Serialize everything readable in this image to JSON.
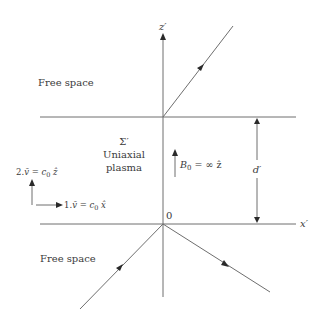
{
  "diagram": {
    "regions": {
      "top": "Free space",
      "middle_symbol": "Σ′",
      "middle_line1": "Uniaxial",
      "middle_line2": "plasma",
      "bottom": "Free space"
    },
    "axes": {
      "vertical_label": "z′",
      "horizontal_label": "x′",
      "origin_label": "0"
    },
    "field": {
      "label_prefix": "B",
      "label_sub": "0",
      "label_rest": " = ∞ ẑ"
    },
    "thickness": {
      "label": "d′"
    },
    "velocities": [
      {
        "prefix": "1.",
        "vec": "v̄",
        "eq": " = ",
        "c": "c",
        "c_sub": "0",
        "dir": " x̂"
      },
      {
        "prefix": "2.",
        "vec": "v̄",
        "eq": " = ",
        "c": "c",
        "c_sub": "0",
        "dir": " ẑ"
      }
    ]
  }
}
